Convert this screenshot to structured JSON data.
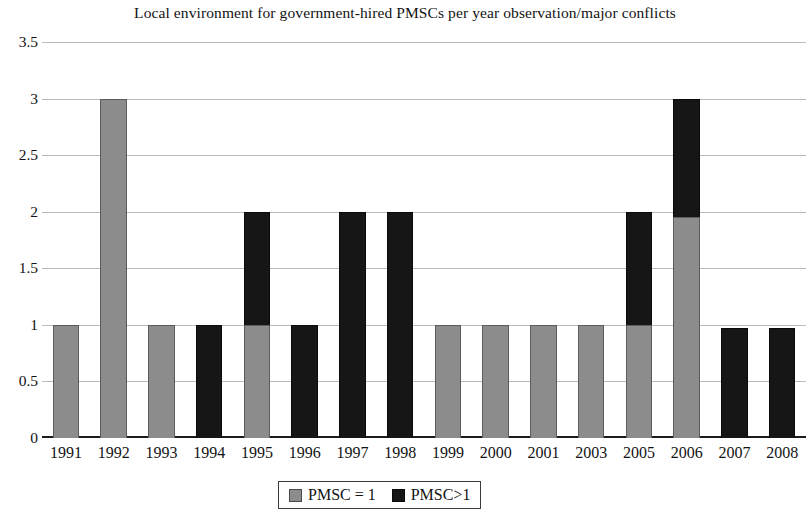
{
  "chart_data": {
    "type": "bar",
    "title": "Local environment for government-hired PMSCs per year observation/major conflicts",
    "xlabel": "",
    "ylabel": "",
    "stacked": true,
    "grid": true,
    "legend_position": "bottom",
    "ylim": [
      0,
      3.5
    ],
    "yticks": [
      "0",
      "0.5",
      "1",
      "1.5",
      "2",
      "2.5",
      "3",
      "3.5"
    ],
    "ytick_values": [
      0,
      0.5,
      1,
      1.5,
      2,
      2.5,
      3,
      3.5
    ],
    "categories": [
      "1991",
      "1992",
      "1993",
      "1994",
      "1995",
      "1996",
      "1997",
      "1998",
      "1999",
      "2000",
      "2001",
      "2003",
      "2005",
      "2006",
      "2007",
      "2008"
    ],
    "series": [
      {
        "name": "PMSC = 1",
        "color": "#8c8c8c",
        "values": [
          1,
          3,
          1,
          0,
          1,
          0,
          0,
          0,
          1,
          1,
          1,
          1,
          1,
          1.95,
          0,
          0
        ]
      },
      {
        "name": "PMSC>1",
        "color": "#161616",
        "values": [
          0,
          0,
          0,
          1,
          1,
          1,
          2,
          2,
          0,
          0,
          0,
          0,
          1,
          1.05,
          0.97,
          0.97
        ]
      }
    ],
    "totals": [
      1,
      3,
      1,
      1,
      2,
      1,
      2,
      2,
      1,
      1,
      1,
      1,
      2,
      3,
      0.97,
      0.97
    ]
  },
  "legend": {
    "items": [
      {
        "label": "PMSC = 1",
        "swatch": "gray"
      },
      {
        "label": "PMSC>1",
        "swatch": "black"
      }
    ]
  }
}
